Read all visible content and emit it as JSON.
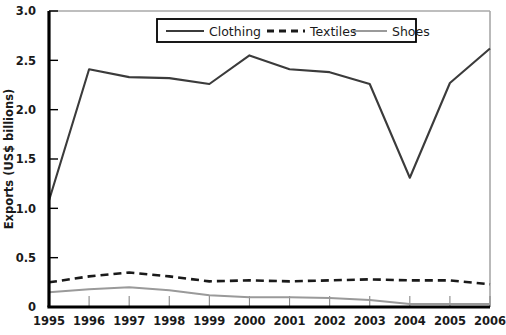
{
  "chart_data": {
    "type": "line",
    "title": "",
    "xlabel": "",
    "ylabel": "Exports (US$ billions)",
    "x": [
      1995,
      1996,
      1997,
      1998,
      1999,
      2000,
      2001,
      2002,
      2003,
      2004,
      2005,
      2006
    ],
    "xtick_labels": [
      "1995",
      "1996",
      "1997",
      "1998",
      "1999",
      "2000",
      "2001",
      "2002",
      "2003",
      "2004",
      "2005",
      "2006"
    ],
    "ytick_labels": [
      "0",
      "0.5",
      "1.0",
      "1.5",
      "2.0",
      "2.5",
      "3.0"
    ],
    "ytick_values": [
      0,
      0.5,
      1.0,
      1.5,
      2.0,
      2.5,
      3.0
    ],
    "ylim": [
      0,
      3.0
    ],
    "xlim": [
      1995,
      2006
    ],
    "grid": false,
    "legend_position": "top-center-inside",
    "series": [
      {
        "name": "Clothing",
        "color": "#3b3b3b",
        "style": "solid",
        "values": [
          1.08,
          2.41,
          2.33,
          2.32,
          2.26,
          2.55,
          2.41,
          2.38,
          2.26,
          1.31,
          2.27,
          2.62
        ]
      },
      {
        "name": "Textiles",
        "color": "#1a1a1a",
        "style": "dashed",
        "values": [
          0.25,
          0.31,
          0.35,
          0.31,
          0.26,
          0.27,
          0.26,
          0.27,
          0.28,
          0.27,
          0.27,
          0.23
        ]
      },
      {
        "name": "Shoes",
        "color": "#9a9a9a",
        "style": "solid",
        "values": [
          0.15,
          0.18,
          0.2,
          0.17,
          0.12,
          0.1,
          0.1,
          0.09,
          0.07,
          0.03,
          0.03,
          0.03
        ]
      }
    ]
  },
  "legend": {
    "items": [
      {
        "label": "Clothing"
      },
      {
        "label": "Textiles"
      },
      {
        "label": "Shoes"
      }
    ]
  },
  "axes": {
    "y_title": "Exports (US$ billions)"
  },
  "colors": {
    "clothing": "#3b3b3b",
    "textiles": "#1a1a1a",
    "shoes": "#9a9a9a",
    "axis": "#000000",
    "plot_border": "#a8a8a8",
    "background": "#ffffff"
  }
}
